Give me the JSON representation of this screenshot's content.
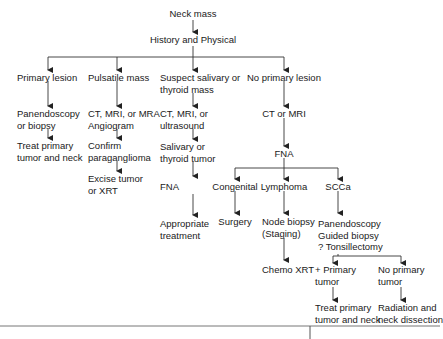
{
  "flowchart": {
    "root": "Neck mass",
    "history": "History and Physical",
    "branches": {
      "primary_lesion": {
        "label": "Primary lesion",
        "step1": [
          "Panendoscopy",
          "or biopsy"
        ],
        "step2": [
          "Treat primary",
          "tumor and neck"
        ]
      },
      "pulsatile_mass": {
        "label": "Pulsatile mass",
        "step1": [
          "CT, MRI, or MRA",
          "Angiogram"
        ],
        "step2": [
          "Confirm",
          "paraganglioma"
        ],
        "step3": [
          "Excise tumor",
          "or XRT"
        ]
      },
      "salivary_thyroid": {
        "label": [
          "Suspect salivary or",
          "thyroid mass"
        ],
        "step1": [
          "CT, MRI, or",
          "ultrasound"
        ],
        "step2": [
          "Salivary or",
          "thyroid tumor"
        ],
        "step3": "FNA",
        "step4": [
          "Appropriate",
          "treatment"
        ]
      },
      "no_primary": {
        "label": "No primary lesion",
        "step1": "CT or MRI",
        "step2": "FNA",
        "congenital": {
          "label": "Congenital",
          "next": "Surgery"
        },
        "lymphoma": {
          "label": "Lymphoma",
          "next": [
            "Node biopsy",
            "(Staging)"
          ],
          "final": "Chemo XRT"
        },
        "scca": {
          "label": "SCCa",
          "next": [
            "Panendoscopy",
            "Guided biopsy",
            "? Tonsillectomy"
          ],
          "plus_primary": {
            "label": [
              "+ Primary",
              "tumor"
            ],
            "next": [
              "Treat primary",
              "tumor and neck"
            ]
          },
          "no_primary": {
            "label": [
              "No primary",
              "tumor"
            ],
            "next": [
              "Radiation and",
              "neck dissection"
            ]
          }
        }
      }
    }
  }
}
